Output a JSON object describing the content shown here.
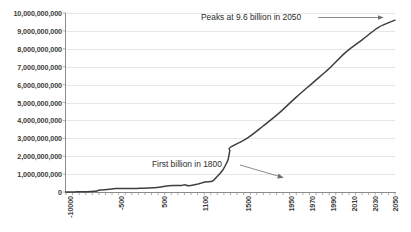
{
  "chart_data": {
    "type": "line",
    "title": "",
    "subtitle": "",
    "xlabel": "",
    "ylabel": "",
    "grid": true,
    "legend": false,
    "xlim": [
      -10000,
      2050
    ],
    "ylim": [
      0,
      10000000000
    ],
    "y_ticks": [
      "10,000,000,000",
      "9,000,000,000",
      "8,000,000,000",
      "7,000,000,000",
      "6,000,000,000",
      "5,000,000,000",
      "4,000,000,000",
      "3,000,000,000",
      "2,000,000,000",
      "1,000,000,000",
      "0"
    ],
    "y_tick_values": [
      10000000000,
      9000000000,
      8000000000,
      7000000000,
      6000000000,
      5000000000,
      4000000000,
      3000000000,
      2000000000,
      1000000000,
      0
    ],
    "x_ticks": [
      "-10000",
      "-500",
      "500",
      "1100",
      "1500",
      "1950",
      "1970",
      "1990",
      "2010",
      "2030",
      "2050"
    ],
    "x_tick_values": [
      -10000,
      -500,
      500,
      1100,
      1500,
      1950,
      1970,
      1990,
      2010,
      2030,
      2050
    ],
    "series": [
      {
        "name": "World population",
        "color": "#3f3f3f",
        "x": [
          -10000,
          -9000,
          -8000,
          -7000,
          -6000,
          -5000,
          -4000,
          -3000,
          -2000,
          -1000,
          -500,
          -200,
          1,
          200,
          400,
          600,
          800,
          1000,
          1100,
          1200,
          1300,
          1340,
          1400,
          1500,
          1600,
          1700,
          1750,
          1800,
          1850,
          1900,
          1920,
          1940,
          1950,
          1960,
          1970,
          1980,
          1990,
          2000,
          2010,
          2020,
          2030,
          2040,
          2050
        ],
        "values": [
          4000000,
          5000000,
          6000000,
          7000000,
          9000000,
          12000000,
          18000000,
          25000000,
          40000000,
          60000000,
          100000000,
          150000000,
          190000000,
          190000000,
          190000000,
          200000000,
          220000000,
          265000000,
          320000000,
          360000000,
          360000000,
          400000000,
          350000000,
          440000000,
          560000000,
          600000000,
          790000000,
          1000000000,
          1260000000,
          1650000000,
          1860000000,
          2300000000,
          2500000000,
          3000000000,
          3700000000,
          4450000000,
          5300000000,
          6100000000,
          6900000000,
          7800000000,
          8500000000,
          9200000000,
          9600000000
        ]
      }
    ],
    "annotations": [
      {
        "id": "peak",
        "text": "Peaks at 9.6 billion in 2050",
        "points_to_x": 2050,
        "points_to_y": 9600000000
      },
      {
        "id": "first-billion",
        "text": "First billion in 1800",
        "points_to_x": 1800,
        "points_to_y": 1000000000
      }
    ]
  }
}
